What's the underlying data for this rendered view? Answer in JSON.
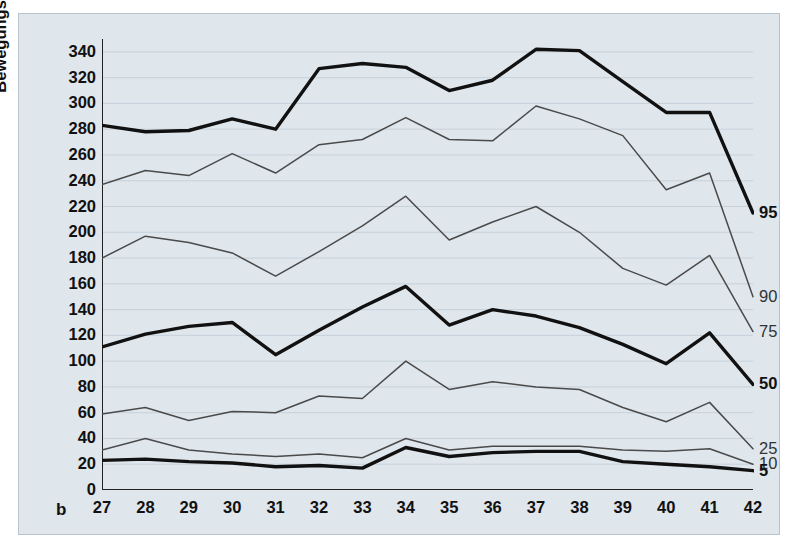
{
  "figure": {
    "panel_letter": "b",
    "background_color": "#dfe6ec",
    "line_color_bold": "#111111",
    "line_color_thin": "#4a4a4a",
    "grid_color": "#c2cdd6"
  },
  "chart_data": {
    "type": "line",
    "title": "",
    "subtitle": "",
    "xlabel": "",
    "ylabel": "Bewegungsdauer pro 10 min",
    "xlim": [
      27,
      42
    ],
    "ylim": [
      0,
      350
    ],
    "yticks": [
      0,
      20,
      40,
      60,
      80,
      100,
      120,
      140,
      160,
      180,
      200,
      220,
      240,
      260,
      280,
      300,
      320,
      340
    ],
    "ytick_labels": [
      "0",
      "20",
      "40",
      "60",
      "80",
      "100",
      "120",
      "140",
      "160",
      "180",
      "200",
      "220",
      "240",
      "260",
      "280",
      "300",
      "320",
      "340"
    ],
    "xticks": [
      27,
      28,
      29,
      30,
      31,
      32,
      33,
      34,
      35,
      36,
      37,
      38,
      39,
      40,
      41,
      42
    ],
    "xtick_labels": [
      "27",
      "28",
      "29",
      "30",
      "31",
      "32",
      "33",
      "34",
      "35",
      "36",
      "37",
      "38",
      "39",
      "40",
      "41",
      "42"
    ],
    "grid": true,
    "grid_axis": "y",
    "legend": "right-end-labels",
    "x": [
      27,
      28,
      29,
      30,
      31,
      32,
      33,
      34,
      35,
      36,
      37,
      38,
      39,
      40,
      41,
      42
    ],
    "series": [
      {
        "name": "95",
        "label": "95",
        "emphasis": "bold",
        "values": [
          283,
          278,
          279,
          288,
          280,
          327,
          331,
          328,
          310,
          318,
          342,
          341,
          317,
          293,
          293,
          215
        ]
      },
      {
        "name": "90",
        "label": "90",
        "emphasis": "thin",
        "values": [
          237,
          248,
          244,
          261,
          246,
          268,
          272,
          289,
          272,
          271,
          298,
          288,
          275,
          233,
          246,
          150
        ]
      },
      {
        "name": "75",
        "label": "75",
        "emphasis": "thin",
        "values": [
          180,
          197,
          192,
          184,
          166,
          185,
          205,
          228,
          194,
          208,
          220,
          200,
          172,
          159,
          182,
          123
        ]
      },
      {
        "name": "50",
        "label": "50",
        "emphasis": "bold",
        "values": [
          111,
          121,
          127,
          130,
          105,
          124,
          142,
          158,
          128,
          140,
          135,
          126,
          113,
          98,
          122,
          82
        ]
      },
      {
        "name": "25",
        "label": "25",
        "emphasis": "thin",
        "values": [
          59,
          64,
          54,
          61,
          60,
          73,
          71,
          100,
          78,
          84,
          80,
          78,
          64,
          53,
          68,
          32
        ]
      },
      {
        "name": "10",
        "label": "10",
        "emphasis": "thin",
        "values": [
          31,
          40,
          31,
          28,
          26,
          28,
          25,
          40,
          31,
          34,
          34,
          34,
          31,
          30,
          32,
          20
        ]
      },
      {
        "name": "5",
        "label": "5",
        "emphasis": "bold",
        "values": [
          23,
          24,
          22,
          21,
          18,
          19,
          17,
          33,
          26,
          29,
          30,
          30,
          22,
          20,
          18,
          15
        ]
      }
    ]
  }
}
